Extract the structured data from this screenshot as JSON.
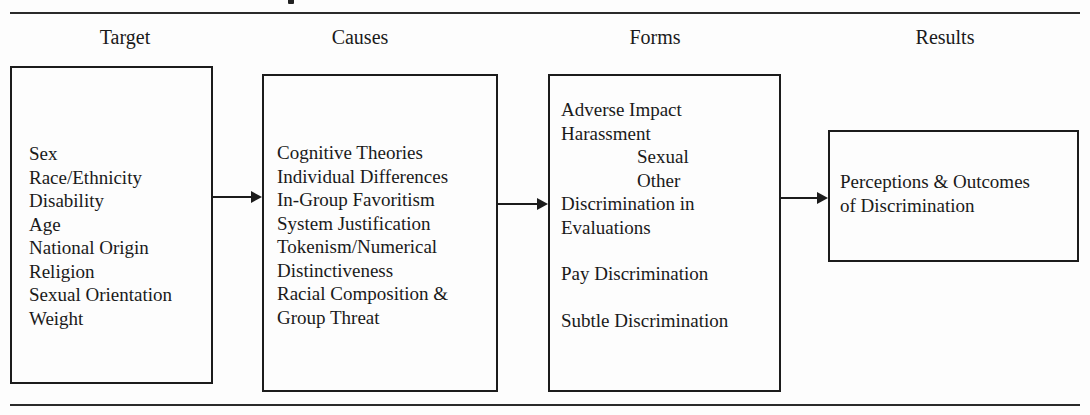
{
  "figure": {
    "columns": [
      {
        "header": "Target",
        "items": [
          "Sex",
          "Race/Ethnicity",
          "Disability",
          "Age",
          "National Origin",
          "Religion",
          "Sexual Orientation",
          "Weight"
        ]
      },
      {
        "header": "Causes",
        "items": [
          "Cognitive Theories",
          "Individual Differences",
          "In-Group Favoritism",
          "System Justification",
          "Tokenism/Numerical",
          "Distinctiveness",
          "Racial Composition &",
          "Group Threat"
        ]
      },
      {
        "header": "Forms",
        "items": [
          "Adverse Impact",
          "Harassment",
          "Sexual",
          "Other",
          "Discrimination in",
          "Evaluations",
          "Pay Discrimination",
          "Subtle Discrimination"
        ]
      },
      {
        "header": "Results",
        "items": [
          "Perceptions & Outcomes",
          "of Discrimination"
        ]
      }
    ],
    "edges": [
      {
        "from": "Target",
        "to": "Causes"
      },
      {
        "from": "Causes",
        "to": "Forms"
      },
      {
        "from": "Forms",
        "to": "Results"
      }
    ]
  }
}
